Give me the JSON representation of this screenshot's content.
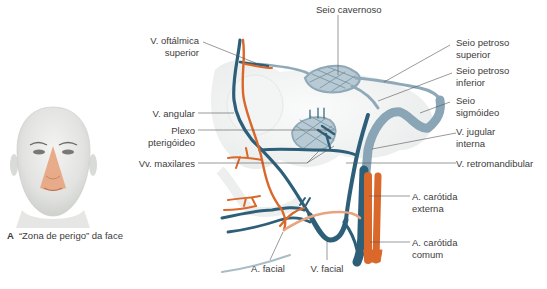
{
  "panel_a": {
    "letter": "A",
    "caption": "“Zona de perigo” da face",
    "highlight_color": "#e8a47f"
  },
  "colors": {
    "vein": "#2e5f78",
    "sinus": "#8fa9b8",
    "artery": "#d9682a",
    "leader": "#555555"
  },
  "labels": {
    "seio_cavernoso": "Seio cavernoso",
    "v_oftalmica_l1": "V. oftálmica",
    "v_oftalmica_l2": "superior",
    "seio_petroso_sup_l1": "Seio petroso",
    "seio_petroso_sup_l2": "superior",
    "seio_petroso_inf_l1": "Seio petroso",
    "seio_petroso_inf_l2": "inferior",
    "seio_sigmoideo_l1": "Seio",
    "seio_sigmoideo_l2": "sigmóideo",
    "v_angular": "V. angular",
    "plexo_l1": "Plexo",
    "plexo_l2": "pterigóideo",
    "v_jugular_l1": "V. jugular",
    "v_jugular_l2": "interna",
    "vv_maxilares": "Vv. maxilares",
    "v_retromandibular": "V. retromandibular",
    "a_carotida_ext_l1": "A. carótida",
    "a_carotida_ext_l2": "externa",
    "a_carotida_com_l1": "A. carótida",
    "a_carotida_com_l2": "comum",
    "a_facial": "A. facial",
    "v_facial": "V. facial"
  }
}
